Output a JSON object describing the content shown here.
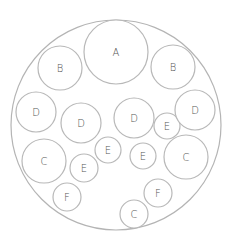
{
  "diagram": {
    "type": "circle-packing",
    "outer": {
      "cx": 116,
      "cy": 125,
      "r": 105
    },
    "stroke_color": "#b8b8b8",
    "label_color": "#555555",
    "circles": [
      {
        "label": "A",
        "cx": 116,
        "cy": 52,
        "r": 32
      },
      {
        "label": "B",
        "cx": 60,
        "cy": 68,
        "r": 22
      },
      {
        "label": "B",
        "cx": 173,
        "cy": 67,
        "r": 22
      },
      {
        "label": "D",
        "cx": 36,
        "cy": 112,
        "r": 20
      },
      {
        "label": "D",
        "cx": 81,
        "cy": 123,
        "r": 20
      },
      {
        "label": "D",
        "cx": 134,
        "cy": 118,
        "r": 20
      },
      {
        "label": "E",
        "cx": 167,
        "cy": 126,
        "r": 13
      },
      {
        "label": "D",
        "cx": 195,
        "cy": 110,
        "r": 20
      },
      {
        "label": "C",
        "cx": 44,
        "cy": 161,
        "r": 22
      },
      {
        "label": "E",
        "cx": 108,
        "cy": 150,
        "r": 13
      },
      {
        "label": "E",
        "cx": 143,
        "cy": 156,
        "r": 13
      },
      {
        "label": "C",
        "cx": 186,
        "cy": 157,
        "r": 22
      },
      {
        "label": "E",
        "cx": 84,
        "cy": 168,
        "r": 14
      },
      {
        "label": "F",
        "cx": 67,
        "cy": 197,
        "r": 14
      },
      {
        "label": "F",
        "cx": 158,
        "cy": 193,
        "r": 14
      },
      {
        "label": "C",
        "cx": 134,
        "cy": 214,
        "r": 14
      }
    ]
  }
}
